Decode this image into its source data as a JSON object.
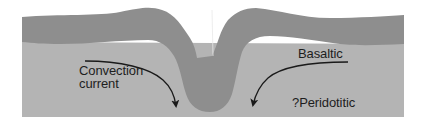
{
  "diagram": {
    "type": "cross-section",
    "colors": {
      "background": "#ffffff",
      "mantle_layer": "#b4b4b4",
      "crust_layer": "#8e8e8e",
      "arrow": "#1a1a1a",
      "text": "#1e1e1e"
    },
    "labels": {
      "convection_line1": "Convection",
      "convection_line2": "current",
      "basaltic": "Basaltic",
      "peridotitic": "?Peridotitic"
    },
    "layers": [
      {
        "name": "crust",
        "description": "dark grey upper layer folding downward at center"
      },
      {
        "name": "mantle",
        "description": "light grey lower layer"
      }
    ],
    "arrows": [
      {
        "name": "left-convection-arrow",
        "direction": "down-right toward fold"
      },
      {
        "name": "right-convection-arrow",
        "direction": "down-left toward fold"
      }
    ]
  }
}
